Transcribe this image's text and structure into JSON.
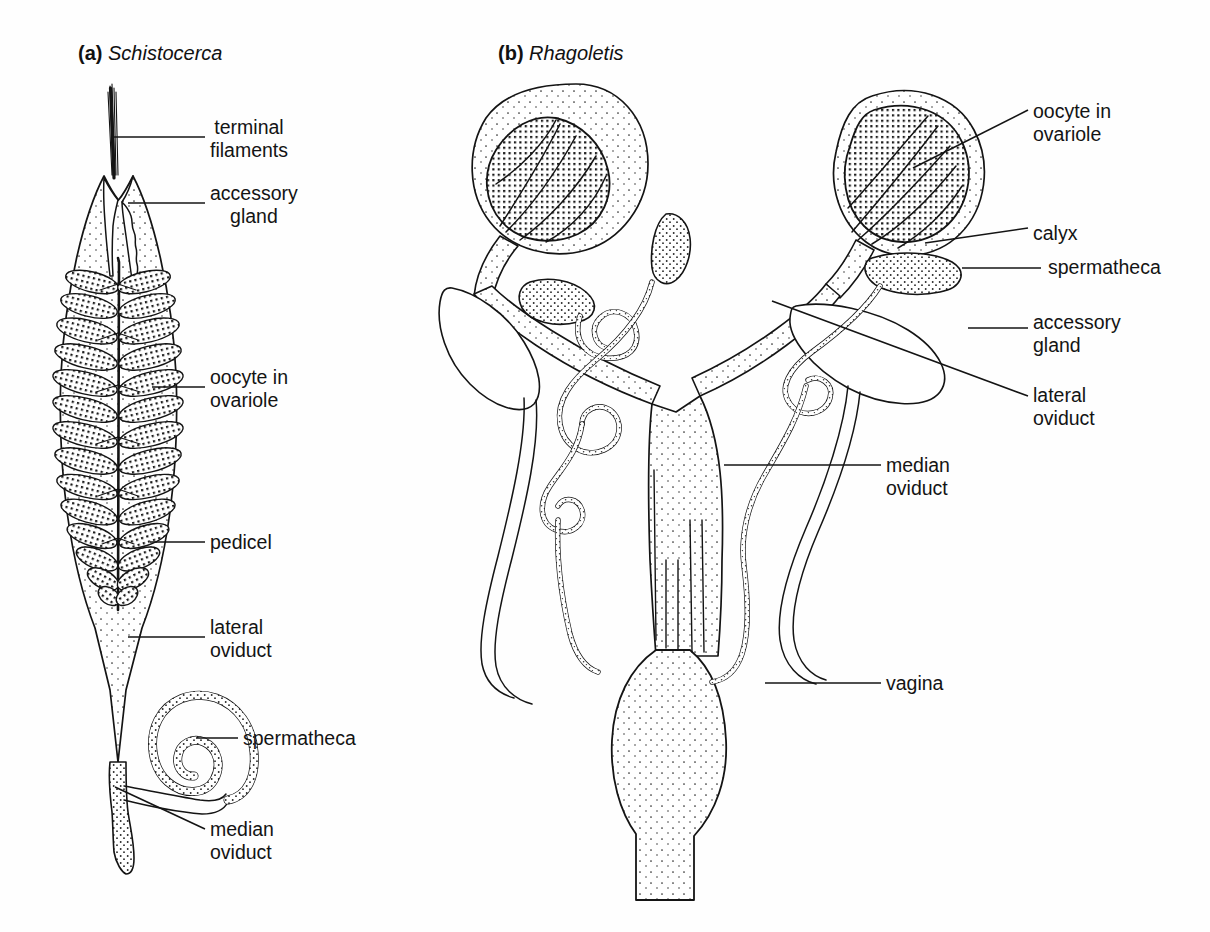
{
  "figure": {
    "type": "scientific-illustration",
    "background_color": "#fefefe",
    "ink_color": "#141414"
  },
  "panels": [
    {
      "id": "a",
      "marker": "(a)",
      "species": "Schistocerca",
      "title_x": 78,
      "title_y": 42,
      "labels": [
        {
          "name": "terminal-filaments",
          "text": "terminal\nfilaments",
          "align": "ctr",
          "x": 210,
          "y": 116,
          "leader": [
            [
              112,
              137
            ],
            [
              205,
              137
            ]
          ]
        },
        {
          "name": "accessory-gland",
          "text": "accessory\ngland",
          "align": "ctr",
          "x": 210,
          "y": 182,
          "leader": [
            [
              128,
              203
            ],
            [
              205,
              203
            ]
          ]
        },
        {
          "name": "oocyte-in-ovariole",
          "text": "oocyte in\novariole",
          "align": "lft",
          "x": 210,
          "y": 366,
          "leader": [
            [
              152,
              387
            ],
            [
              205,
              387
            ]
          ]
        },
        {
          "name": "pedicel",
          "text": "pedicel",
          "align": "lft",
          "x": 210,
          "y": 531,
          "leader": [
            [
              150,
              542
            ],
            [
              205,
              542
            ]
          ]
        },
        {
          "name": "lateral-oviduct",
          "text": "lateral\noviduct",
          "align": "lft",
          "x": 210,
          "y": 616,
          "leader": [
            [
              128,
              637
            ],
            [
              205,
              637
            ]
          ]
        },
        {
          "name": "spermatheca",
          "text": "spermatheca",
          "align": "lft",
          "x": 243,
          "y": 727,
          "leader": [
            [
              196,
              738
            ],
            [
              238,
              738
            ]
          ]
        },
        {
          "name": "median-oviduct",
          "text": "median\noviduct",
          "align": "lft",
          "x": 210,
          "y": 818,
          "leader": [
            [
              115,
              787
            ],
            [
              205,
              829
            ]
          ]
        }
      ]
    },
    {
      "id": "b",
      "marker": "(b)",
      "species": "Rhagoletis",
      "title_x": 498,
      "title_y": 42,
      "labels": [
        {
          "name": "oocyte-in-ovariole",
          "text": "oocyte in\novariole",
          "align": "lft",
          "x": 1033,
          "y": 100,
          "leader": [
            [
              913,
              168
            ],
            [
              1028,
              110
            ]
          ]
        },
        {
          "name": "calyx",
          "text": "calyx",
          "align": "lft",
          "x": 1033,
          "y": 222,
          "leader": [
            [
              925,
              243
            ],
            [
              1028,
              228
            ]
          ]
        },
        {
          "name": "spermatheca",
          "text": "spermatheca",
          "align": "lft",
          "x": 1048,
          "y": 256,
          "leader": [
            [
              962,
              268
            ],
            [
              1041,
              268
            ]
          ]
        },
        {
          "name": "accessory-gland",
          "text": "accessory\ngland",
          "align": "lft",
          "x": 1033,
          "y": 311,
          "leader": [
            [
              968,
              328
            ],
            [
              1028,
              328
            ]
          ]
        },
        {
          "name": "lateral-oviduct",
          "text": "lateral\noviduct",
          "align": "lft",
          "x": 1033,
          "y": 384,
          "leader": [
            [
              772,
              301
            ],
            [
              1028,
              396
            ]
          ]
        },
        {
          "name": "median-oviduct",
          "text": "median\noviduct",
          "align": "lft",
          "x": 886,
          "y": 454,
          "leader": [
            [
              724,
              465
            ],
            [
              881,
              465
            ]
          ]
        },
        {
          "name": "vagina",
          "text": "vagina",
          "align": "lft",
          "x": 886,
          "y": 672,
          "leader": [
            [
              765,
              683
            ],
            [
              881,
              683
            ]
          ]
        }
      ]
    }
  ]
}
